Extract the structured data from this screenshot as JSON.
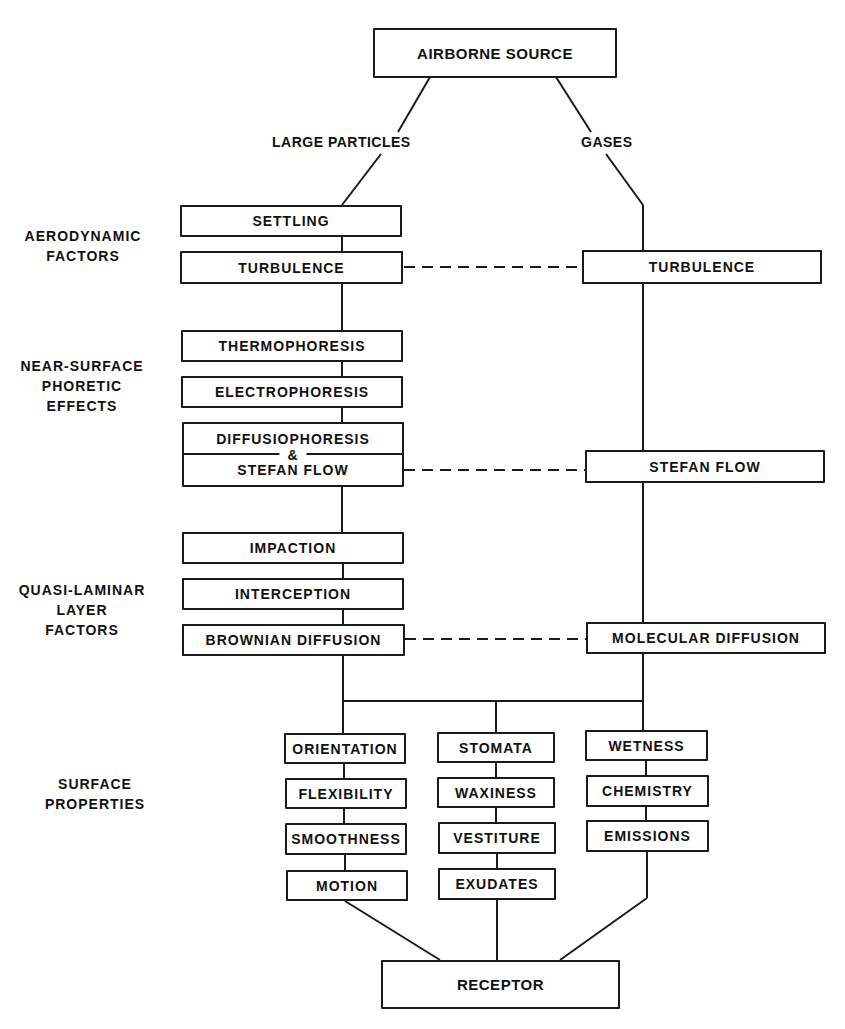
{
  "diagram": {
    "type": "flowchart",
    "source": "AIRBORNE SOURCE",
    "branches": {
      "particles": "LARGE PARTICLES",
      "gases": "GASES"
    },
    "categories": {
      "aerodynamic": "AERODYNAMIC\nFACTORS",
      "phoretic": "NEAR-SURFACE\nPHORETIC\nEFFECTS",
      "quasi_laminar": "QUASI-LAMINAR\nLAYER\nFACTORS",
      "surface": "SURFACE\nPROPERTIES"
    },
    "particles_column": {
      "settling": "SETTLING",
      "turbulence": "TURBULENCE",
      "thermophoresis": "THERMOPHORESIS",
      "electrophoresis": "ELECTROPHORESIS",
      "diffusiophoresis": "DIFFUSIOPHORESIS",
      "ampersand": "&",
      "stefan_flow": "STEFAN FLOW",
      "impaction": "IMPACTION",
      "interception": "INTERCEPTION",
      "brownian": "BROWNIAN DIFFUSION"
    },
    "gases_column": {
      "turbulence": "TURBULENCE",
      "stefan_flow": "STEFAN FLOW",
      "molecular": "MOLECULAR DIFFUSION"
    },
    "surface_columns": {
      "left": [
        "ORIENTATION",
        "FLEXIBILITY",
        "SMOOTHNESS",
        "MOTION"
      ],
      "middle": [
        "STOMATA",
        "WAXINESS",
        "VESTITURE",
        "EXUDATES"
      ],
      "right": [
        "WETNESS",
        "CHEMISTRY",
        "EMISSIONS"
      ]
    },
    "receptor": "RECEPTOR",
    "colors": {
      "line": "#1a1a1a",
      "background": "#ffffff"
    }
  }
}
